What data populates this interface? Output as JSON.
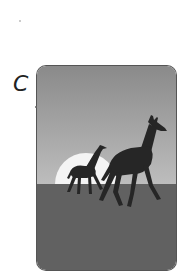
{
  "option": {
    "label": "C"
  },
  "card": {
    "description": "Silhouettes of two giraffes walking across savanna at sunset",
    "colors": {
      "sky_top": "#8a8a8a",
      "sky_bottom": "#b8b8b8",
      "sun": "#f4f4f4",
      "ground": "#616161",
      "silhouette": "#262626",
      "border": "#555555"
    },
    "elements": [
      "sky",
      "sun",
      "ground",
      "large-giraffe",
      "small-giraffe"
    ]
  }
}
